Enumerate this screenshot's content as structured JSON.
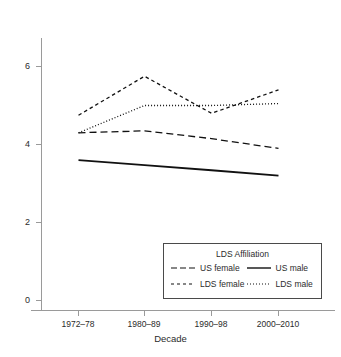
{
  "chart_data": {
    "type": "line",
    "title": "",
    "subtitle": "",
    "xlabel": "Decade",
    "ylabel": "",
    "categories": [
      "1972–78",
      "1980–89",
      "1990–98",
      "2000–2010"
    ],
    "x_tick_labels": [
      "1972–78",
      "1980–89",
      "1990–98",
      "2000–2010"
    ],
    "y_tick_labels": [
      "0",
      "2",
      "4",
      "6"
    ],
    "y_ticks": [
      0,
      2,
      4,
      6
    ],
    "ylim": [
      0,
      7
    ],
    "grid": false,
    "legend_position": "lower right",
    "legend_title": "LDS Affiliation",
    "series": [
      {
        "name": "US female",
        "linestyle": "long-dash",
        "color": "#111111",
        "values": [
          4.3,
          4.35,
          4.15,
          3.9
        ]
      },
      {
        "name": "US male",
        "linestyle": "solid",
        "color": "#111111",
        "values": [
          3.6,
          3.47,
          3.34,
          3.2
        ]
      },
      {
        "name": "LDS female",
        "linestyle": "short-dash",
        "color": "#111111",
        "values": [
          4.75,
          5.75,
          4.8,
          5.4
        ]
      },
      {
        "name": "LDS male",
        "linestyle": "dotted",
        "color": "#111111",
        "values": [
          4.3,
          5.0,
          5.0,
          5.05
        ]
      }
    ]
  },
  "legend": {
    "title": "LDS Affiliation",
    "entries": [
      {
        "label": "US female",
        "style": "long-dash"
      },
      {
        "label": "US male",
        "style": "solid"
      },
      {
        "label": "LDS female",
        "style": "short-dash"
      },
      {
        "label": "LDS male",
        "style": "dotted"
      }
    ]
  },
  "axes": {
    "x_title": "Decade",
    "y_tick_0": "0",
    "y_tick_1": "2",
    "y_tick_2": "4",
    "y_tick_3": "6",
    "x_tick_0": "1972–78",
    "x_tick_1": "1980–89",
    "x_tick_2": "1990–98",
    "x_tick_3": "2000–2010"
  },
  "colors": {
    "line": "#111111",
    "axis": "#8a8a8a",
    "text": "#2b2b2b",
    "legend_border": "#4a4a4a",
    "background": "#ffffff"
  }
}
